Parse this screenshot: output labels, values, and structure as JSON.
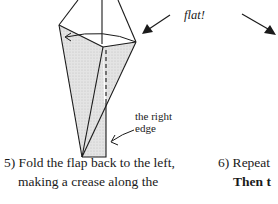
{
  "diagram": {
    "annotation_top": "flat!",
    "annotation_edge_line1": "the right",
    "annotation_edge_line2": "edge",
    "fill_color": "#dcdcdc",
    "stroke_color": "#1a1a1a"
  },
  "steps": [
    {
      "number": "5)",
      "line1": "5) Fold the flap back to the left,",
      "line2": "making a crease along the",
      "line3": "right edge. (Cut off)"
    },
    {
      "number": "6)",
      "line1": "6) Repeat",
      "line2": "Then t"
    }
  ]
}
